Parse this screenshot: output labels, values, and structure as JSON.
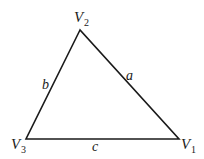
{
  "diagram": {
    "type": "triangle",
    "vertices": [
      {
        "name": "V1",
        "letter": "V",
        "subscript": "1",
        "x": 179,
        "y": 139
      },
      {
        "name": "V2",
        "letter": "V",
        "subscript": "2",
        "x": 80,
        "y": 30
      },
      {
        "name": "V3",
        "letter": "V",
        "subscript": "3",
        "x": 26,
        "y": 139
      }
    ],
    "sides": [
      {
        "label": "a",
        "from": "V1",
        "to": "V2"
      },
      {
        "label": "b",
        "from": "V2",
        "to": "V3"
      },
      {
        "label": "c",
        "from": "V3",
        "to": "V1"
      }
    ],
    "stroke_color": "#1a1a1a"
  }
}
